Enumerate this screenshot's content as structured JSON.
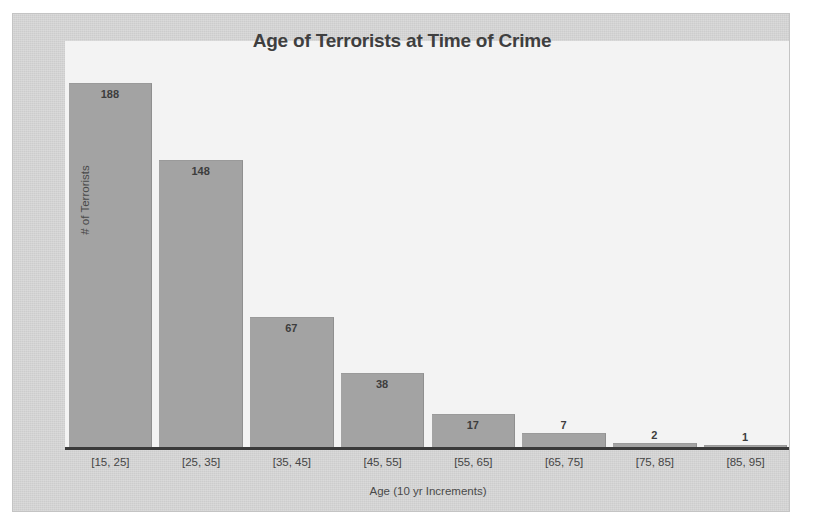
{
  "chart_data": {
    "type": "bar",
    "title": "Age of Terrorists at Time of Crime",
    "xlabel": "Age (10 yr Increments)",
    "ylabel": "# of Terrorists",
    "categories": [
      "[15, 25]",
      "[25, 35]",
      "[35, 45]",
      "[45, 55]",
      "[55, 65]",
      "[65, 75]",
      "[75, 85]",
      "[85, 95]"
    ],
    "values": [
      188,
      148,
      67,
      38,
      17,
      7,
      2,
      1
    ],
    "ylim": [
      0,
      188
    ],
    "grid": false,
    "legend": false,
    "axis_ticks_shown": false,
    "data_labels_shown": true,
    "bars": [
      {
        "category": "[15, 25]",
        "value": 188,
        "label": "188"
      },
      {
        "category": "[25, 35]",
        "value": 148,
        "label": "148"
      },
      {
        "category": "[35, 45]",
        "value": 67,
        "label": "67"
      },
      {
        "category": "[45, 55]",
        "value": 38,
        "label": "38"
      },
      {
        "category": "[55, 65]",
        "value": 17,
        "label": "17"
      },
      {
        "category": "[65, 75]",
        "value": 7,
        "label": "7"
      },
      {
        "category": "[75, 85]",
        "value": 2,
        "label": "2"
      },
      {
        "category": "[85, 95]",
        "value": 1,
        "label": "1"
      }
    ],
    "colors": {
      "bar_fill": "#a3a3a3",
      "plot_background": "#f3f3f3",
      "frame_background": "#d6d6d6",
      "axis_line": "#3a3a3a",
      "title_text": "#3f3f3f",
      "label_text": "#454545"
    }
  }
}
